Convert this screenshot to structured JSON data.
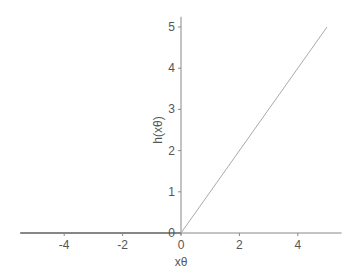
{
  "chart_data": {
    "type": "line",
    "title": "",
    "xlabel": "xθ",
    "ylabel": "h(xθ)",
    "xlim": [
      -5.5,
      5.5
    ],
    "ylim": [
      0,
      5.2
    ],
    "grid": false,
    "xticks": [
      -4,
      -2,
      0,
      2,
      4
    ],
    "xtick_labels": [
      "-4",
      "-2",
      "0",
      "2",
      "4"
    ],
    "yticks": [
      0,
      1,
      2,
      3,
      4,
      5
    ],
    "ytick_labels": [
      "0",
      "1",
      "2",
      "3",
      "4",
      "5"
    ],
    "series": [
      {
        "name": "h(xθ) = max(0, xθ)",
        "x": [
          -5.5,
          0,
          5
        ],
        "y": [
          0,
          0,
          5
        ],
        "color": "#aaaaaa"
      }
    ],
    "axis_color": "#888888",
    "dark_axis_segment_color": "#444444"
  }
}
